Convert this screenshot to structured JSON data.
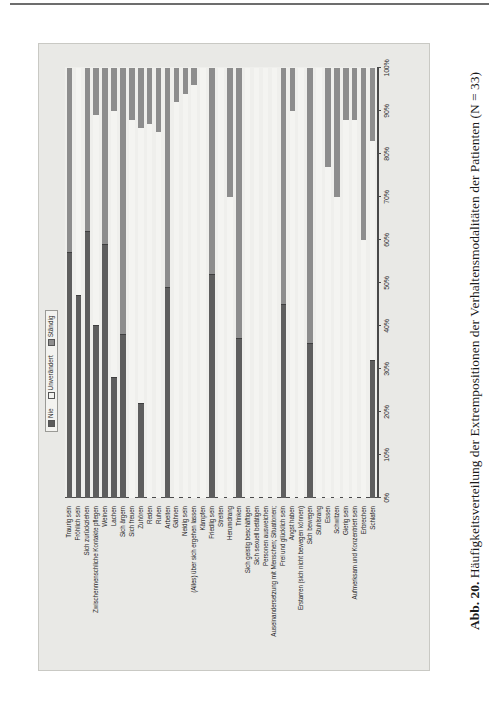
{
  "caption": {
    "number": "Abb. 20.",
    "text": "Häufigkeitsverteilung der Extrempositionen der Verhaltensmodalitäten der Patienten (N = 33)"
  },
  "legend": {
    "items": [
      {
        "label": "Nie",
        "color": "#5e5e5e"
      },
      {
        "label": "Unverändert",
        "color": "#f4f4f1"
      },
      {
        "label": "Ständig",
        "color": "#8d8d8d"
      }
    ]
  },
  "chart_data": {
    "type": "bar",
    "subtype": "stacked-percent-horizontal",
    "title": "Häufigkeitsverteilung der Extrempositionen der Verhaltensmodalitäten der Patienten (N = 33)",
    "xlabel": "",
    "ylabel": "",
    "xlim": [
      0,
      100
    ],
    "xticks": [
      "0%",
      "10%",
      "20%",
      "30%",
      "40%",
      "50%",
      "60%",
      "70%",
      "80%",
      "90%",
      "100%"
    ],
    "grid": false,
    "legend_position": "top-right",
    "series": [
      {
        "name": "Nie",
        "color": "#5e5e5e"
      },
      {
        "name": "Unverändert",
        "color": "#f4f4f1"
      },
      {
        "name": "Ständig",
        "color": "#8d8d8d"
      }
    ],
    "categories": [
      "Traurig sein",
      "Fröhlich sein",
      "Sich zurückziehen",
      "Zwischenmenschliche Kontakte pflegen",
      "Weinen",
      "Lachen",
      "Sich ärgern",
      "Sich freuen",
      "Zuhören",
      "Reden",
      "Ruhen",
      "Arbeiten",
      "Gähnen",
      "Neidig sein",
      "(Alles) über sich ergehen lassen",
      "Kämpfen",
      "Friedlig sein",
      "Streiten",
      "Herumdrang",
      "Trinken",
      "Sich geistig beschäftigen",
      "Sich sexuell betätigen",
      "Personen ausweichen",
      "Auseinandersetzung mit Menschen; Situationen;",
      "Frei und glücklich sein",
      "Angst haben",
      "Erstarren (sich nicht bewegen können)",
      "Sich bewegen",
      "Stuhlsrang",
      "Essen",
      "Schwitzen",
      "Gierig sein",
      "Aufmerksam und Konzentriert sein",
      "Erbrechen",
      "Schlafen"
    ],
    "values": [
      {
        "category": "Traurig sein",
        "Nie": 57,
        "Unverändert": 0,
        "Ständig": 43
      },
      {
        "category": "Fröhlich sein",
        "Nie": 47,
        "Unverändert": 53,
        "Ständig": 0
      },
      {
        "category": "Sich zurückziehen",
        "Nie": 62,
        "Unverändert": 0,
        "Ständig": 38
      },
      {
        "category": "Zwischenmenschliche Kontakte pflegen",
        "Nie": 40,
        "Unverändert": 49,
        "Ständig": 11
      },
      {
        "category": "Weinen",
        "Nie": 59,
        "Unverändert": 0,
        "Ständig": 41
      },
      {
        "category": "Lachen",
        "Nie": 28,
        "Unverändert": 62,
        "Ständig": 10
      },
      {
        "category": "Sich ärgern",
        "Nie": 38,
        "Unverändert": 0,
        "Ständig": 62
      },
      {
        "category": "Sich freuen",
        "Nie": 0,
        "Unverändert": 88,
        "Ständig": 12
      },
      {
        "category": "Zuhören",
        "Nie": 22,
        "Unverändert": 64,
        "Ständig": 14
      },
      {
        "category": "Reden",
        "Nie": 0,
        "Unverändert": 87,
        "Ständig": 13
      },
      {
        "category": "Ruhen",
        "Nie": 0,
        "Unverändert": 85,
        "Ständig": 15
      },
      {
        "category": "Arbeiten",
        "Nie": 49,
        "Unverändert": 0,
        "Ständig": 51
      },
      {
        "category": "Gähnen",
        "Nie": 0,
        "Unverändert": 92,
        "Ständig": 8
      },
      {
        "category": "Neidig sein",
        "Nie": 0,
        "Unverändert": 94,
        "Ständig": 6
      },
      {
        "category": "(Alles) über sich ergehen lassen",
        "Nie": 0,
        "Unverändert": 96,
        "Ständig": 4
      },
      {
        "category": "Kämpfen",
        "Nie": 0,
        "Unverändert": 100,
        "Ständig": 0
      },
      {
        "category": "Friedlig sein",
        "Nie": 52,
        "Unverändert": 0,
        "Ständig": 48
      },
      {
        "category": "Streiten",
        "Nie": 0,
        "Unverändert": 100,
        "Ständig": 0
      },
      {
        "category": "Herumdrang",
        "Nie": 0,
        "Unverändert": 70,
        "Ständig": 30
      },
      {
        "category": "Trinken",
        "Nie": 37,
        "Unverändert": 0,
        "Ständig": 63
      },
      {
        "category": "Sich geistig beschäftigen",
        "Nie": 0,
        "Unverändert": 100,
        "Ständig": 0
      },
      {
        "category": "Sich sexuell betätigen",
        "Nie": 0,
        "Unverändert": 100,
        "Ständig": 0
      },
      {
        "category": "Personen ausweichen",
        "Nie": 0,
        "Unverändert": 100,
        "Ständig": 0
      },
      {
        "category": "Auseinandersetzung mit Menschen; Situationen;",
        "Nie": 0,
        "Unverändert": 100,
        "Ständig": 0
      },
      {
        "category": "Frei und glücklich sein",
        "Nie": 45,
        "Unverändert": 0,
        "Ständig": 55
      },
      {
        "category": "Angst haben",
        "Nie": 0,
        "Unverändert": 90,
        "Ständig": 10
      },
      {
        "category": "Erstarren (sich nicht bewegen können)",
        "Nie": 0,
        "Unverändert": 100,
        "Ständig": 0
      },
      {
        "category": "Sich bewegen",
        "Nie": 36,
        "Unverändert": 0,
        "Ständig": 64
      },
      {
        "category": "Stuhlsrang",
        "Nie": 0,
        "Unverändert": 100,
        "Ständig": 0
      },
      {
        "category": "Essen",
        "Nie": 0,
        "Unverändert": 77,
        "Ständig": 23
      },
      {
        "category": "Schwitzen",
        "Nie": 0,
        "Unverändert": 70,
        "Ständig": 30
      },
      {
        "category": "Gierig sein",
        "Nie": 0,
        "Unverändert": 88,
        "Ständig": 12
      },
      {
        "category": "Aufmerksam und Konzentriert sein",
        "Nie": 0,
        "Unverändert": 88,
        "Ständig": 12
      },
      {
        "category": "Erbrechen",
        "Nie": 0,
        "Unverändert": 60,
        "Ständig": 40
      },
      {
        "category": "Schlafen",
        "Nie": 32,
        "Unverändert": 51,
        "Ständig": 17
      }
    ]
  }
}
